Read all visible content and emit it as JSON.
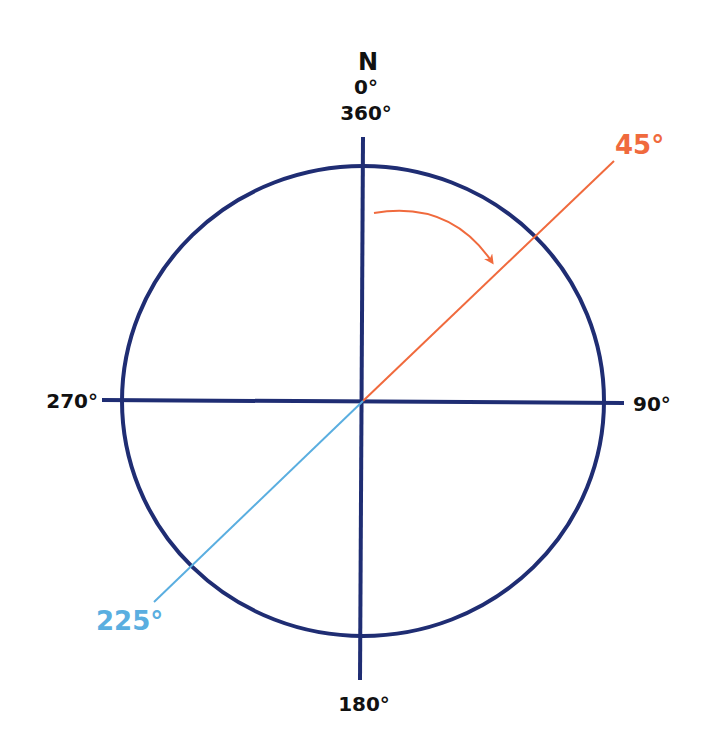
{
  "diagram": {
    "type": "compass-bearing",
    "colors": {
      "axis": "#1f2d73",
      "circle": "#1f2d73",
      "bearing_45": "#f06a3d",
      "bearing_225": "#5aaee0",
      "label_text": "#111111",
      "arrow": "#f06a3d"
    },
    "labels": {
      "north_letter": "N",
      "north_deg": "0°",
      "north_deg_alt": "360°",
      "east": "90°",
      "south": "180°",
      "west": "270°",
      "bearing_ne": "45°",
      "bearing_sw": "225°"
    },
    "bearings": [
      {
        "name": "45°",
        "angle": 45,
        "color": "#f06a3d"
      },
      {
        "name": "225°",
        "angle": 225,
        "color": "#5aaee0"
      }
    ],
    "rotation_arrow": {
      "direction": "clockwise",
      "from": "N",
      "toward": "45°"
    }
  }
}
